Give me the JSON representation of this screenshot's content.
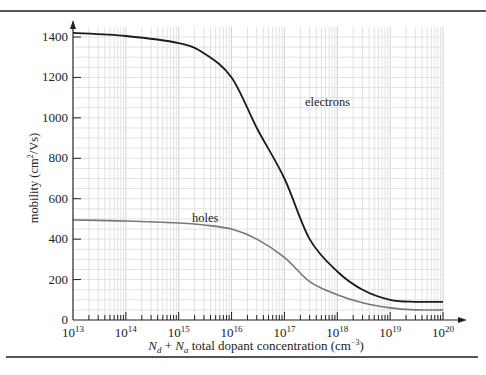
{
  "chart_data": {
    "type": "line",
    "title": "",
    "xlabel": "N_d + N_a total dopant concentration (cm^-3)",
    "xlabel_parts": {
      "n1": "N",
      "s1": "d",
      "plus": " + ",
      "n2": "N",
      "s2": "a",
      "rest": " total dopant concentration (cm",
      "exp": "−3",
      "close": ")"
    },
    "ylabel": "mobility (cm^2/Vs)",
    "ylabel_parts": {
      "pre": "mobility (cm",
      "exp": "2",
      "post": "/Vs)"
    },
    "xscale": "log",
    "xlim": [
      10000000000000.0,
      1e+20
    ],
    "ylim": [
      0,
      1450
    ],
    "grid": true,
    "legend": "inline labels",
    "x_ticks": [
      {
        "base": "10",
        "exp": "13"
      },
      {
        "base": "10",
        "exp": "14"
      },
      {
        "base": "10",
        "exp": "15"
      },
      {
        "base": "10",
        "exp": "16"
      },
      {
        "base": "10",
        "exp": "17"
      },
      {
        "base": "10",
        "exp": "18"
      },
      {
        "base": "10",
        "exp": "19"
      },
      {
        "base": "10",
        "exp": "20"
      }
    ],
    "y_ticks": [
      "0",
      "200",
      "400",
      "600",
      "800",
      "1000",
      "1200",
      "1400"
    ],
    "x": [
      10000000000000.0,
      100000000000000.0,
      1000000000000000.0,
      3000000000000000.0,
      1e+16,
      3e+16,
      1e+17,
      3e+17,
      1e+18,
      3e+18,
      1e+19,
      3e+19,
      1e+20
    ],
    "series": [
      {
        "name": "electrons",
        "color": "#1a1a1a",
        "values": [
          1420,
          1405,
          1370,
          1320,
          1200,
          950,
          700,
          400,
          240,
          150,
          100,
          90,
          90
        ]
      },
      {
        "name": "holes",
        "color": "#777777",
        "values": [
          495,
          490,
          480,
          470,
          450,
          400,
          310,
          190,
          125,
          85,
          60,
          50,
          50
        ]
      }
    ],
    "annotations": [
      {
        "text": "electrons"
      },
      {
        "text": "holes"
      }
    ]
  }
}
